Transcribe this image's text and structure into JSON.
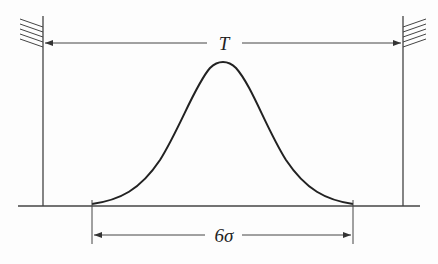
{
  "diagram": {
    "labels": {
      "tolerance": "T",
      "spread": "6σ"
    },
    "colors": {
      "ink": "#333333",
      "curve": "#222222",
      "background": "#fdfdfd"
    },
    "elements": [
      "left-wall-with-hatching",
      "right-wall-with-hatching",
      "baseline",
      "tolerance-dimension-arrow",
      "normal-distribution-curve",
      "spread-dimension-arrow"
    ]
  }
}
